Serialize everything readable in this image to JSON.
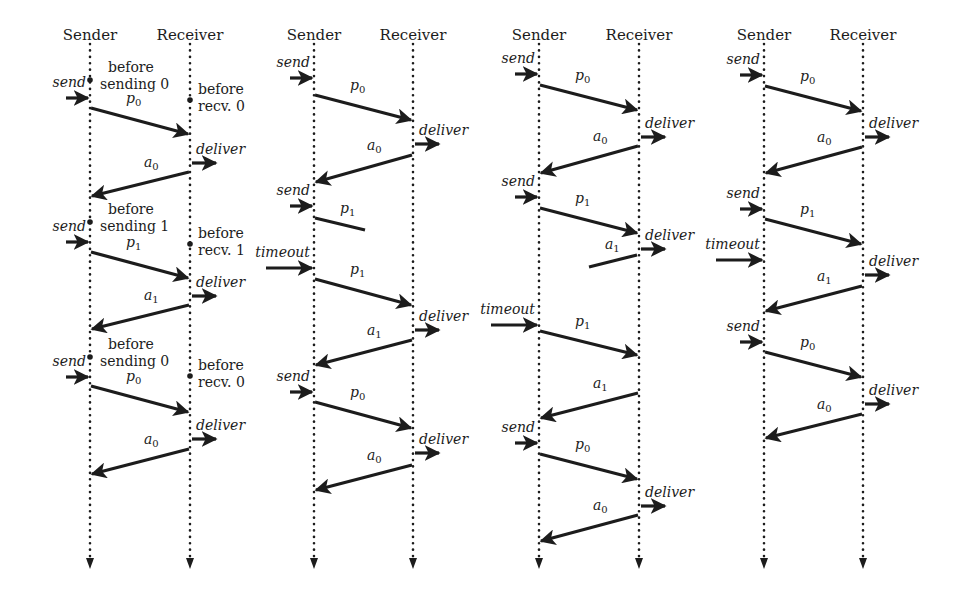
{
  "figure": {
    "width": 953,
    "height": 589,
    "ink_color": "#1c1c1c",
    "lifeline_top": 44,
    "lifeline_bottom": 560,
    "header_y": 40
  },
  "panels": [
    {
      "id": "a",
      "sender_x": 90,
      "receiver_x": 190,
      "sender_label": "Sender",
      "receiver_label": "Receiver",
      "states": [
        {
          "side": "sender",
          "y": 80,
          "lines": [
            "before",
            "sending 0"
          ]
        },
        {
          "side": "receiver",
          "y": 100,
          "lines": [
            "before",
            "recv. 0"
          ]
        },
        {
          "side": "sender",
          "y": 222,
          "lines": [
            "before",
            "sending 1"
          ]
        },
        {
          "side": "receiver",
          "y": 244,
          "lines": [
            "before",
            "recv. 1"
          ]
        },
        {
          "side": "sender",
          "y": 357,
          "lines": [
            "before",
            "sending 0"
          ]
        },
        {
          "side": "receiver",
          "y": 376,
          "lines": [
            "before",
            "recv. 0"
          ]
        }
      ],
      "events": [
        {
          "kind": "send",
          "label": "send",
          "y": 98
        },
        {
          "kind": "deliver",
          "label": "deliver",
          "y": 163
        },
        {
          "kind": "send",
          "label": "send",
          "y": 242
        },
        {
          "kind": "deliver",
          "label": "deliver",
          "y": 296
        },
        {
          "kind": "send",
          "label": "send",
          "y": 377
        },
        {
          "kind": "deliver",
          "label": "deliver",
          "y": 439
        }
      ],
      "messages": [
        {
          "name": "p",
          "sub": "0",
          "dir": "right",
          "y1": 108,
          "y2": 134,
          "complete": true
        },
        {
          "name": "a",
          "sub": "0",
          "dir": "left",
          "y1": 172,
          "y2": 196,
          "complete": true
        },
        {
          "name": "p",
          "sub": "1",
          "dir": "right",
          "y1": 252,
          "y2": 278,
          "complete": true
        },
        {
          "name": "a",
          "sub": "1",
          "dir": "left",
          "y1": 305,
          "y2": 329,
          "complete": true
        },
        {
          "name": "p",
          "sub": "0",
          "dir": "right",
          "y1": 386,
          "y2": 412,
          "complete": true
        },
        {
          "name": "a",
          "sub": "0",
          "dir": "left",
          "y1": 449,
          "y2": 474,
          "complete": true
        }
      ]
    },
    {
      "id": "b",
      "sender_x": 314,
      "receiver_x": 413,
      "sender_label": "Sender",
      "receiver_label": "Receiver",
      "states": [],
      "events": [
        {
          "kind": "send",
          "label": "send",
          "y": 78
        },
        {
          "kind": "deliver",
          "label": "deliver",
          "y": 144
        },
        {
          "kind": "send",
          "label": "send",
          "y": 206
        },
        {
          "kind": "timeout",
          "label": "timeout",
          "y": 268
        },
        {
          "kind": "deliver",
          "label": "deliver",
          "y": 330
        },
        {
          "kind": "send",
          "label": "send",
          "y": 392
        },
        {
          "kind": "deliver",
          "label": "deliver",
          "y": 453
        }
      ],
      "messages": [
        {
          "name": "p",
          "sub": "0",
          "dir": "right",
          "y1": 95,
          "y2": 120,
          "complete": true
        },
        {
          "name": "a",
          "sub": "0",
          "dir": "left",
          "y1": 155,
          "y2": 182,
          "complete": true
        },
        {
          "name": "p",
          "sub": "1",
          "dir": "right",
          "y1": 218,
          "y2": 230,
          "complete": false,
          "lost_x": 365
        },
        {
          "name": "p",
          "sub": "1",
          "dir": "right",
          "y1": 279,
          "y2": 305,
          "complete": true
        },
        {
          "name": "a",
          "sub": "1",
          "dir": "left",
          "y1": 340,
          "y2": 365,
          "complete": true
        },
        {
          "name": "p",
          "sub": "0",
          "dir": "right",
          "y1": 402,
          "y2": 428,
          "complete": true
        },
        {
          "name": "a",
          "sub": "0",
          "dir": "left",
          "y1": 465,
          "y2": 490,
          "complete": true
        }
      ]
    },
    {
      "id": "c",
      "sender_x": 539,
      "receiver_x": 639,
      "sender_label": "Sender",
      "receiver_label": "Receiver",
      "states": [],
      "events": [
        {
          "kind": "send",
          "label": "send",
          "y": 74
        },
        {
          "kind": "deliver",
          "label": "deliver",
          "y": 137
        },
        {
          "kind": "send",
          "label": "send",
          "y": 197
        },
        {
          "kind": "deliver",
          "label": "deliver",
          "y": 249
        },
        {
          "kind": "timeout",
          "label": "timeout",
          "y": 325
        },
        {
          "kind": "send",
          "label": "send",
          "y": 443
        },
        {
          "kind": "deliver",
          "label": "deliver",
          "y": 506
        }
      ],
      "messages": [
        {
          "name": "p",
          "sub": "0",
          "dir": "right",
          "y1": 85,
          "y2": 110,
          "complete": true
        },
        {
          "name": "a",
          "sub": "0",
          "dir": "left",
          "y1": 146,
          "y2": 173,
          "complete": true
        },
        {
          "name": "p",
          "sub": "1",
          "dir": "right",
          "y1": 208,
          "y2": 233,
          "complete": true
        },
        {
          "name": "a",
          "sub": "1",
          "dir": "left-late",
          "y1": 255,
          "y2": 267,
          "complete": false,
          "lost_x": 589
        },
        {
          "name": "p",
          "sub": "1",
          "dir": "right",
          "y1": 331,
          "y2": 355,
          "complete": true
        },
        {
          "name": "a",
          "sub": "1",
          "dir": "left",
          "y1": 393,
          "y2": 418,
          "complete": true
        },
        {
          "name": "p",
          "sub": "0",
          "dir": "right",
          "y1": 454,
          "y2": 479,
          "complete": true
        },
        {
          "name": "a",
          "sub": "0",
          "dir": "left",
          "y1": 515,
          "y2": 541,
          "complete": true
        }
      ]
    },
    {
      "id": "d",
      "sender_x": 764,
      "receiver_x": 863,
      "sender_label": "Sender",
      "receiver_label": "Receiver",
      "states": [],
      "events": [
        {
          "kind": "send",
          "label": "send",
          "y": 75
        },
        {
          "kind": "deliver",
          "label": "deliver",
          "y": 137
        },
        {
          "kind": "send",
          "label": "send",
          "y": 209
        },
        {
          "kind": "timeout",
          "label": "timeout",
          "y": 260
        },
        {
          "kind": "deliver",
          "label": "deliver",
          "y": 275
        },
        {
          "kind": "send",
          "label": "send",
          "y": 342
        },
        {
          "kind": "deliver",
          "label": "deliver",
          "y": 404
        }
      ],
      "messages": [
        {
          "name": "p",
          "sub": "0",
          "dir": "right",
          "y1": 86,
          "y2": 111,
          "complete": true
        },
        {
          "name": "a",
          "sub": "0",
          "dir": "left",
          "y1": 147,
          "y2": 173,
          "complete": true
        },
        {
          "name": "p",
          "sub": "1",
          "dir": "right",
          "y1": 219,
          "y2": 244,
          "complete": true
        },
        {
          "name": "a",
          "sub": "1",
          "dir": "left",
          "y1": 286,
          "y2": 311,
          "complete": true
        },
        {
          "name": "p",
          "sub": "0",
          "dir": "right",
          "y1": 352,
          "y2": 377,
          "complete": true
        },
        {
          "name": "a",
          "sub": "0",
          "dir": "left",
          "y1": 414,
          "y2": 438,
          "complete": true
        }
      ]
    }
  ]
}
